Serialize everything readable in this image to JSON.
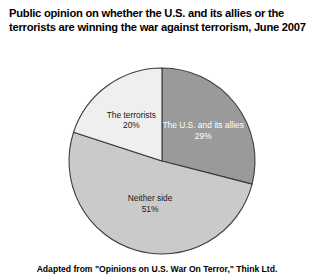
{
  "title": {
    "line1": "Public opinion on whether the U.S. and its allies or the",
    "line2": "terrorists are winning the war against terrorism, June 2007"
  },
  "footer": {
    "note": "Adapted from \"Opinions on U.S. War On Terror,\" Think Ltd."
  },
  "chart_data": {
    "type": "pie",
    "title": "Public opinion on whether the U.S. and its allies or the terrorists are winning the war against terrorism, June 2007",
    "xlabel": "",
    "ylabel": "",
    "units": "percent",
    "start_angle_deg": 0,
    "direction": "clockwise",
    "legend": "none",
    "labels_inside_slices": true,
    "slices": [
      {
        "name": "the-us-and-its-allies",
        "label": "The U.S. and its allies",
        "value": 29,
        "value_label": "29%",
        "color": "#9a9a9a",
        "text_color": "#ffffff"
      },
      {
        "name": "neither-side",
        "label": "Neither side",
        "value": 51,
        "value_label": "51%",
        "color": "#cacaca",
        "text_color": "#1a1a1a"
      },
      {
        "name": "the-terrorists",
        "label": "The terrorists",
        "value": 20,
        "value_label": "20%",
        "color": "#efefef",
        "text_color": "#1a1a1a"
      }
    ],
    "geometry": {
      "center_x": 162,
      "center_y": 161,
      "radius": 93,
      "outline_color": "#3c3c3c",
      "outline_width": 1.1
    },
    "background": "#ffffff"
  }
}
